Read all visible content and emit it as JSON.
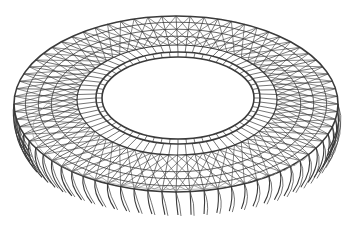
{
  "figure": {
    "style": "wireframe-line-drawing",
    "colors": {
      "background": "#ffffff",
      "line": "#3a3a3a",
      "line_light": "#8a8a8a"
    },
    "geometry": {
      "outer_ellipse": {
        "cx": 176,
        "cy": 104,
        "rx": 162,
        "ry": 88
      },
      "roof_edge_ellipse": {
        "cx": 177,
        "cy": 100,
        "rx": 100,
        "ry": 55
      },
      "inner_opening": {
        "cx": 178,
        "cy": 98,
        "rx": 76,
        "ry": 41
      },
      "base_ellipse": {
        "cx": 178,
        "cy": 150,
        "rx": 150,
        "ry": 65
      },
      "radial_count": 72
    }
  }
}
